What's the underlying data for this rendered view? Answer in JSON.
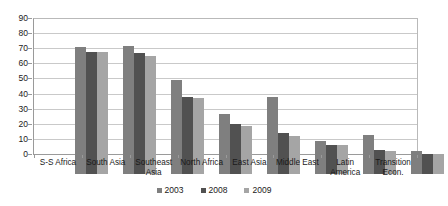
{
  "chart_data": {
    "type": "bar",
    "title": "",
    "subtitle": "",
    "xlabel": "",
    "ylabel": "",
    "ylim": [
      0,
      90
    ],
    "ytick_step": 10,
    "yticks": [
      90,
      80,
      70,
      60,
      50,
      40,
      30,
      20,
      10,
      0
    ],
    "grid": true,
    "legend_position": "bottom",
    "categories": [
      "S-S Africa",
      "South Asia",
      "Southeast Asia",
      "North Africa",
      "East Asia",
      "Middle East",
      "Latin America",
      "Transition Econ."
    ],
    "series": [
      {
        "name": "2003",
        "color": "#7f7f7f",
        "values": [
          84,
          85,
          62,
          40,
          51,
          22,
          26,
          15
        ]
      },
      {
        "name": "2008",
        "color": "#515151",
        "values": [
          81,
          80,
          51,
          33,
          27,
          19,
          16,
          13
        ]
      },
      {
        "name": "2009",
        "color": "#a5a5a5",
        "values": [
          81,
          78,
          50,
          32,
          25,
          19,
          15,
          13
        ]
      }
    ]
  },
  "legend": {
    "items": [
      {
        "label": "2003",
        "color": "#7f7f7f"
      },
      {
        "label": "2008",
        "color": "#515151"
      },
      {
        "label": "2009",
        "color": "#a5a5a5"
      }
    ]
  },
  "colors": {
    "plot_border": "#b9b9b9",
    "gridline": "#c9c9c9",
    "axis": "#9a9a9a",
    "text": "#1a1a1a",
    "background": "#ffffff"
  }
}
